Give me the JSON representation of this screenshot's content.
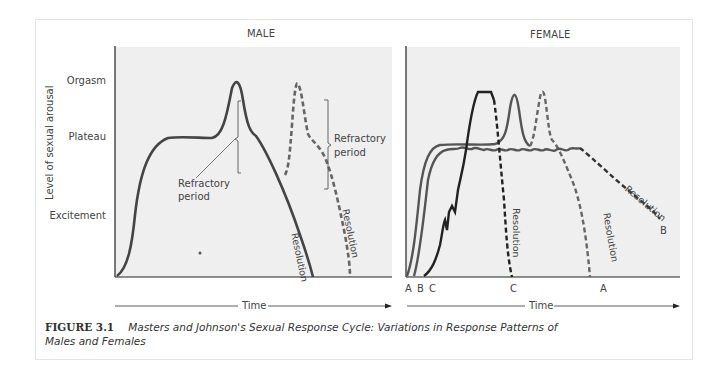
{
  "figure": {
    "label": "FIGURE 3.1",
    "caption_line1": "Masters and Johnson's Sexual Response Cycle: Variations in Response Patterns of",
    "caption_line2": "Males and Females"
  },
  "male_panel": {
    "title": "MALE",
    "y_axis_title": "Level of sexual arousal",
    "y_levels": [
      "Orgasm",
      "Plateau",
      "Excitement"
    ],
    "annotations": {
      "refractory_1": [
        "Refractory",
        "period"
      ],
      "refractory_2": [
        "Refractory",
        "period"
      ],
      "resolution_solid": "Resolution",
      "resolution_dashed": "Resolution"
    },
    "x_axis_label": "Time"
  },
  "female_panel": {
    "title": "FEMALE",
    "annotations": {
      "resolution_c": "Resolution",
      "resolution_a": "Resolution",
      "resolution_b": "Resolution"
    },
    "curve_labels_start": "A B C",
    "curve_label_c": "C",
    "curve_label_a": "A",
    "curve_label_b": "B",
    "x_axis_label": "Time"
  },
  "colors": {
    "panel_bg": "#efefef",
    "line_dark": "#222222",
    "line_gray": "#555555",
    "dashed_gray": "#666666"
  }
}
